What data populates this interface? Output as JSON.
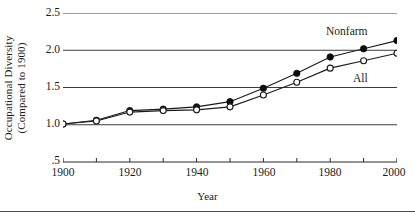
{
  "chart_data": {
    "type": "line",
    "title": "",
    "xlabel": "Year",
    "ylabel": "Occupational Diversity (Compared to 1900)",
    "ylabel_line1": "Occupational Diversity",
    "ylabel_line2": "(Compared to 1900)",
    "x": [
      1900,
      1910,
      1920,
      1930,
      1940,
      1950,
      1960,
      1970,
      1980,
      1990,
      2000
    ],
    "xlim": [
      1900,
      2000
    ],
    "ylim": [
      0.5,
      2.5
    ],
    "grid": "horizontal",
    "legend_position": "inline-annotations",
    "xtick_labels": [
      "1900",
      "1920",
      "1940",
      "1960",
      "1980",
      "2000"
    ],
    "xtick_values": [
      1900,
      1920,
      1940,
      1960,
      1980,
      2000
    ],
    "xminor_tick_values": [
      1910,
      1930,
      1950,
      1970,
      1990
    ],
    "ytick_labels": [
      "2.5",
      "2.0",
      "1.5",
      "1.0",
      ".5"
    ],
    "ytick_values": [
      2.5,
      2.0,
      1.5,
      1.0,
      0.5
    ],
    "gridline_values": [
      2.5,
      2.0,
      1.5,
      1.0
    ],
    "series": [
      {
        "name": "Nonfarm",
        "marker": "filled-circle",
        "values": [
          1.01,
          1.06,
          1.19,
          1.21,
          1.24,
          1.31,
          1.49,
          1.69,
          1.91,
          2.02,
          2.13
        ]
      },
      {
        "name": "All",
        "marker": "open-circle",
        "values": [
          1.01,
          1.05,
          1.17,
          1.19,
          1.2,
          1.24,
          1.4,
          1.57,
          1.76,
          1.86,
          1.96
        ]
      }
    ],
    "annotations": [
      {
        "text": "Nonfarm",
        "x": 1990,
        "y": 2.28
      },
      {
        "text": "All",
        "x": 1978,
        "y": 1.66
      }
    ],
    "colors": {
      "line": "#1a1a1a",
      "marker_fill": "#0d0d0d",
      "marker_open_fill": "#ffffff",
      "grid": "#3d3d3d",
      "axis": "#2b2b2b",
      "text": "#1a1a1a",
      "background": "#ffffff"
    }
  }
}
